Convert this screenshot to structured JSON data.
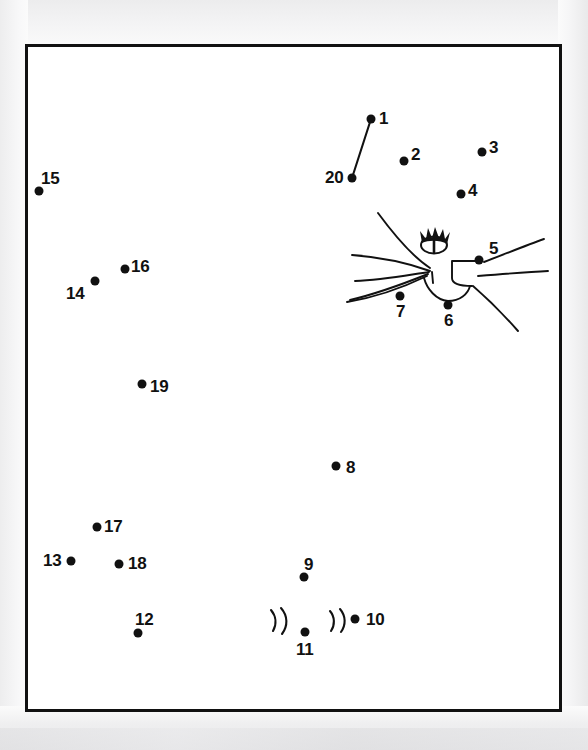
{
  "page": {
    "kind": "connect-the-dots-puzzle",
    "background_color": "#fbfbfb",
    "ink_color": "#111111",
    "paper_color": "#ffffff"
  },
  "frame": {
    "x": 25,
    "y": 44,
    "width": 537,
    "height": 668,
    "border_width": 3,
    "border_color": "#111111"
  },
  "puzzle": {
    "dot_count": 20,
    "subject": "cat-face",
    "dots": [
      {
        "number": "1",
        "x": 371,
        "y": 119,
        "label_x": 379,
        "label_y": 110,
        "label_align": "left"
      },
      {
        "number": "2",
        "x": 404,
        "y": 161,
        "label_x": 411,
        "label_y": 146,
        "label_align": "left"
      },
      {
        "number": "3",
        "x": 482,
        "y": 152,
        "label_x": 489,
        "label_y": 139,
        "label_align": "left"
      },
      {
        "number": "4",
        "x": 461,
        "y": 194,
        "label_x": 468,
        "label_y": 182,
        "label_align": "left"
      },
      {
        "number": "5",
        "x": 479,
        "y": 260,
        "label_x": 489,
        "label_y": 240,
        "label_align": "left"
      },
      {
        "number": "6",
        "x": 448,
        "y": 305,
        "label_x": 444,
        "label_y": 312,
        "label_align": "left"
      },
      {
        "number": "7",
        "x": 400,
        "y": 296,
        "label_x": 396,
        "label_y": 303,
        "label_align": "left"
      },
      {
        "number": "8",
        "x": 336,
        "y": 466,
        "label_x": 346,
        "label_y": 459,
        "label_align": "left"
      },
      {
        "number": "9",
        "x": 304,
        "y": 577,
        "label_x": 304,
        "label_y": 556,
        "label_align": "left"
      },
      {
        "number": "10",
        "x": 355,
        "y": 619,
        "label_x": 366,
        "label_y": 611,
        "label_align": "left"
      },
      {
        "number": "11",
        "x": 305,
        "y": 632,
        "label_x": 296,
        "label_y": 641,
        "label_align": "left"
      },
      {
        "number": "12",
        "x": 138,
        "y": 633,
        "label_x": 135,
        "label_y": 611,
        "label_align": "left"
      },
      {
        "number": "13",
        "x": 71,
        "y": 561,
        "label_x": 43,
        "label_y": 552,
        "label_align": "left"
      },
      {
        "number": "14",
        "x": 95,
        "y": 281,
        "label_x": 66,
        "label_y": 285,
        "label_align": "left"
      },
      {
        "number": "15",
        "x": 39,
        "y": 191,
        "label_x": 41,
        "label_y": 170,
        "label_align": "left"
      },
      {
        "number": "16",
        "x": 125,
        "y": 269,
        "label_x": 131,
        "label_y": 258,
        "label_align": "left"
      },
      {
        "number": "17",
        "x": 97,
        "y": 527,
        "label_x": 104,
        "label_y": 518,
        "label_align": "left"
      },
      {
        "number": "18",
        "x": 119,
        "y": 564,
        "label_x": 128,
        "label_y": 555,
        "label_align": "left"
      },
      {
        "number": "19",
        "x": 142,
        "y": 384,
        "label_x": 150,
        "label_y": 378,
        "label_align": "left"
      },
      {
        "number": "20",
        "x": 352,
        "y": 178,
        "label_x": 325,
        "label_y": 169,
        "label_align": "left"
      }
    ],
    "connected_segments": [
      {
        "from": "20",
        "to": "1"
      }
    ]
  },
  "artwork": {
    "description": "partially drawn cat face with one eye, muzzle and whiskers",
    "strokes": [
      {
        "name": "eye-oval"
      },
      {
        "name": "eye-lashes"
      },
      {
        "name": "eye-pupil"
      },
      {
        "name": "muzzle-curve"
      },
      {
        "name": "chin-curve"
      },
      {
        "name": "whisker-left-upper"
      },
      {
        "name": "whisker-left-middle"
      },
      {
        "name": "whisker-left-lower"
      },
      {
        "name": "whisker-left-bottom"
      },
      {
        "name": "whisker-right-upper"
      },
      {
        "name": "whisker-right-middle"
      },
      {
        "name": "whisker-right-lower"
      },
      {
        "name": "cheek-step-line"
      },
      {
        "name": "fur-tuft-left"
      },
      {
        "name": "fur-tuft-right"
      }
    ]
  }
}
